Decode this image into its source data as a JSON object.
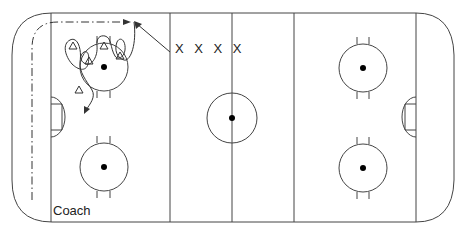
{
  "diagram": {
    "type": "hockey-rink-drill",
    "labels": {
      "coach": "Coach",
      "players_x": "X X X X"
    },
    "players_triangles_count": 5,
    "colors": {
      "lines": "#444444",
      "background": "#ffffff",
      "dot": "#000000"
    },
    "rink": {
      "faceoff_circles": 4,
      "center_circle": 1,
      "blue_lines": 2,
      "center_line": 1,
      "goal_lines": 2
    }
  }
}
